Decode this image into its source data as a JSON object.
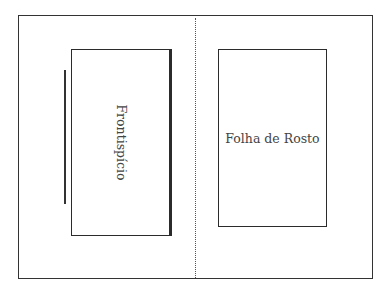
{
  "diagram": {
    "type": "book-spread-layout",
    "pages": [
      {
        "side": "left",
        "label": "Frontispício",
        "label_orientation": "vertical-rotated-90"
      },
      {
        "side": "right",
        "label": "Folha de Rosto",
        "label_orientation": "horizontal"
      }
    ],
    "divider": {
      "style": "dotted"
    },
    "colors": {
      "stroke": "#2b2b2b",
      "text": "#444444",
      "background": "#ffffff"
    }
  }
}
